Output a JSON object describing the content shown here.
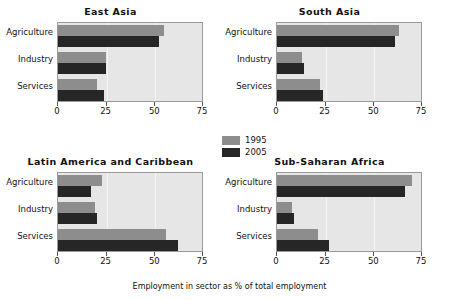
{
  "chart_data": {
    "type": "bar",
    "title": "",
    "xlabel": "Employment in sector as % of total employment",
    "ylabel": "",
    "xlim": [
      0,
      75
    ],
    "xticks": [
      0,
      25,
      50,
      75
    ],
    "xticklabels": [
      "0",
      "25",
      "50",
      "75"
    ],
    "categories": [
      "Agriculture",
      "Industry",
      "Services"
    ],
    "orientation": "horizontal",
    "grid": true,
    "legend_position": "center",
    "legend": [
      "1995",
      "2005"
    ],
    "colors": {
      "1995": "#8d8d8d",
      "2005": "#262626",
      "plot_background": "#e6e6e6",
      "figure_background": "#ffffff",
      "gridline": "#f4f4f4",
      "axis": "#9a9a9a"
    },
    "panels": [
      {
        "title": "East Asia",
        "categories": [
          "Agriculture",
          "Industry",
          "Services"
        ],
        "series": [
          {
            "name": "1995",
            "values": [
              55,
              25,
              20
            ]
          },
          {
            "name": "2005",
            "values": [
              52,
              25,
              24
            ]
          }
        ]
      },
      {
        "title": "South Asia",
        "categories": [
          "Agriculture",
          "Industry",
          "Services"
        ],
        "series": [
          {
            "name": "1995",
            "values": [
              63,
              13,
              22
            ]
          },
          {
            "name": "2005",
            "values": [
              61,
              14,
              24
            ]
          }
        ]
      },
      {
        "title": "Latin America and Caribbean",
        "categories": [
          "Agriculture",
          "Industry",
          "Services"
        ],
        "series": [
          {
            "name": "1995",
            "values": [
              23,
              19,
              56
            ]
          },
          {
            "name": "2005",
            "values": [
              17,
              20,
              62
            ]
          }
        ]
      },
      {
        "title": "Sub-Saharan Africa",
        "categories": [
          "Agriculture",
          "Industry",
          "Services"
        ],
        "series": [
          {
            "name": "1995",
            "values": [
              70,
              8,
              21
            ]
          },
          {
            "name": "2005",
            "values": [
              66,
              9,
              27
            ]
          }
        ]
      }
    ]
  }
}
